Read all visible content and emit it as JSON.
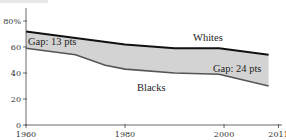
{
  "chart_data": {
    "type": "area",
    "title": "",
    "xlabel": "",
    "ylabel": "",
    "xlim": [
      1960,
      2011
    ],
    "ylim": [
      0,
      80
    ],
    "x_ticks": [
      1960,
      1980,
      2000,
      2011
    ],
    "x_tick_labels": [
      "1960",
      "1980",
      "2000",
      "2011"
    ],
    "y_ticks": [
      0,
      20,
      40,
      60,
      80
    ],
    "y_tick_labels": [
      "0",
      "20",
      "40",
      "60",
      "80%"
    ],
    "grid": false,
    "legend": "inline labels",
    "series": [
      {
        "name": "Whites",
        "color": "#111111",
        "x": [
          1960,
          1970,
          1980,
          1990,
          1999,
          2009
        ],
        "values": [
          72,
          67,
          62,
          59,
          59,
          54
        ]
      },
      {
        "name": "Blacks",
        "color": "#555555",
        "x": [
          1960,
          1970,
          1976,
          1980,
          1990,
          1999,
          2009
        ],
        "values": [
          59,
          54,
          46,
          43,
          40,
          39,
          30
        ]
      }
    ],
    "fill_between": {
      "color": "#d3d3d3"
    },
    "annotations": [
      {
        "text": "Whites",
        "x": 1996,
        "y": 63
      },
      {
        "text": "Blacks",
        "x": 1985,
        "y": 28
      },
      {
        "text": "Gap: 13 pts",
        "x": 1961,
        "y": 61
      },
      {
        "text": "Gap: 24 pts",
        "x": 2000,
        "y": 41
      }
    ]
  },
  "labels": {
    "whites": "Whites",
    "blacks": "Blacks",
    "gap_start": "Gap: 13 pts",
    "gap_end": "Gap: 24 pts"
  }
}
